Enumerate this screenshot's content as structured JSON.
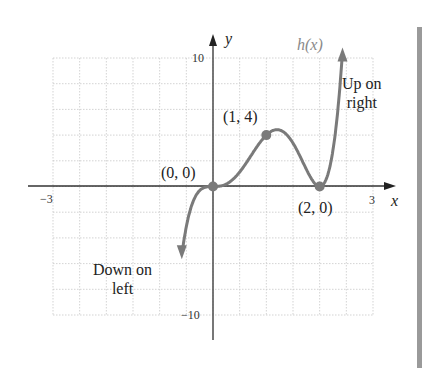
{
  "chart_data": {
    "type": "line",
    "title": "",
    "function_label": "h(x)",
    "xlabel": "x",
    "ylabel": "y",
    "xlim": [
      -3,
      3
    ],
    "ylim": [
      -10,
      10
    ],
    "x_ticks_labeled": [
      "-3",
      "3"
    ],
    "y_ticks_labeled": [
      "10",
      "-10"
    ],
    "grid": true,
    "grid_step": {
      "x": 0.5,
      "y": 2
    },
    "series": [
      {
        "name": "h(x)",
        "formula": "4x^3(x-2)^2",
        "color": "#7a7a7a",
        "x": [
          -0.58,
          -0.5,
          -0.4,
          -0.3,
          -0.2,
          -0.1,
          0,
          0.2,
          0.4,
          0.6,
          0.8,
          1.0,
          1.2,
          1.4,
          1.6,
          1.8,
          2.0,
          2.2,
          2.4,
          2.6,
          2.7
        ],
        "y": [
          -10.0,
          -3.1,
          -1.48,
          -0.57,
          -0.15,
          -0.02,
          0,
          0.1,
          0.66,
          1.69,
          2.95,
          4.0,
          4.42,
          3.95,
          2.62,
          0.93,
          0,
          0.85,
          8.85,
          25.3,
          38.7
        ]
      }
    ],
    "points": [
      {
        "label": "(0, 0)",
        "x": 0,
        "y": 0
      },
      {
        "label": "(1, 4)",
        "x": 1,
        "y": 4
      },
      {
        "label": "(2, 0)",
        "x": 2,
        "y": 0
      }
    ],
    "annotations": [
      {
        "text_line1": "Up on",
        "text_line2": "right"
      },
      {
        "text_line1": "Down on",
        "text_line2": "left"
      }
    ]
  },
  "labels": {
    "y_axis": "y",
    "x_axis": "x",
    "function": "h(x)",
    "y_max": "10",
    "y_min": "−10",
    "x_min": "−3",
    "x_max": "3",
    "point_origin": "(0, 0)",
    "point_one_four": "(1, 4)",
    "point_two_zero": "(2, 0)",
    "up_line1": "Up on",
    "up_line2": "right",
    "down_line1": "Down on",
    "down_line2": "left"
  },
  "colors": {
    "curve": "#7a7a7a",
    "axis": "#333333",
    "grid": "#c8c8c8",
    "sidebar_bar": "#9a9a9a"
  }
}
